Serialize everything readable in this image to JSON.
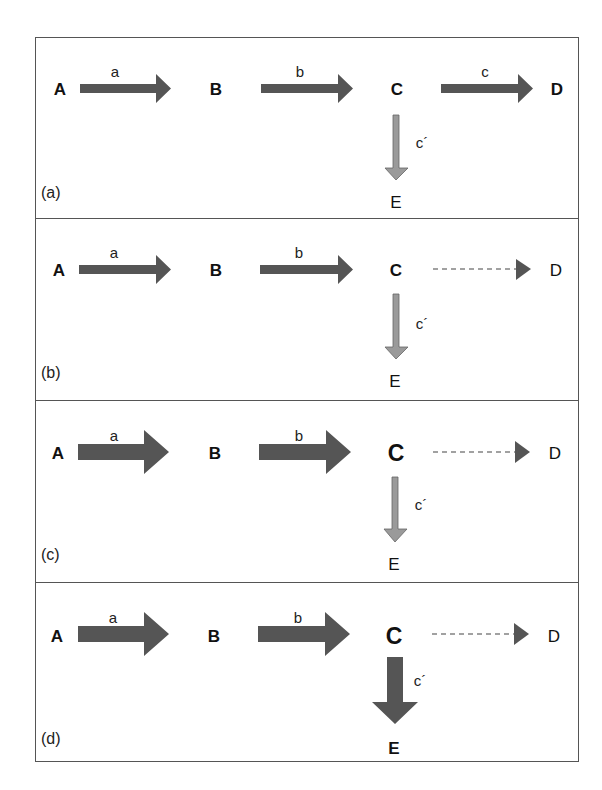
{
  "colors": {
    "strong_arrow": "#555555",
    "weak_arrow": "#9a9a9a",
    "border": "#555555",
    "text": "#111111"
  },
  "panels": [
    {
      "label": "(a)",
      "nodes": {
        "A": "A",
        "B": "B",
        "C": "C",
        "D": "D",
        "E": "E"
      },
      "edges": {
        "a": "a",
        "b": "b",
        "c": "c",
        "c_prime": "c´"
      },
      "styles": {
        "a": "solid-thin",
        "b": "solid-thin",
        "c": "solid-thin",
        "c_prime": "light-thin",
        "C_node": "bold",
        "D_node": "bold",
        "E_node": "regular"
      }
    },
    {
      "label": "(b)",
      "nodes": {
        "A": "A",
        "B": "B",
        "C": "C",
        "D": "D",
        "E": "E"
      },
      "edges": {
        "a": "a",
        "b": "b",
        "c_prime": "c´"
      },
      "styles": {
        "a": "solid-thin",
        "b": "solid-thin",
        "c": "dashed",
        "c_prime": "light-thin",
        "C_node": "bold",
        "D_node": "regular",
        "E_node": "regular"
      }
    },
    {
      "label": "(c)",
      "nodes": {
        "A": "A",
        "B": "B",
        "C": "C",
        "D": "D",
        "E": "E"
      },
      "edges": {
        "a": "a",
        "b": "b",
        "c_prime": "c´"
      },
      "styles": {
        "a": "solid-thick",
        "b": "solid-thick",
        "c": "dashed",
        "c_prime": "light-thin",
        "C_node": "large-bold",
        "D_node": "regular",
        "E_node": "regular"
      }
    },
    {
      "label": "(d)",
      "nodes": {
        "A": "A",
        "B": "B",
        "C": "C",
        "D": "D",
        "E": "E"
      },
      "edges": {
        "a": "a",
        "b": "b",
        "c_prime": "c´"
      },
      "styles": {
        "a": "solid-thick",
        "b": "solid-thick",
        "c": "dashed",
        "c_prime": "solid-thick",
        "C_node": "large-bold",
        "D_node": "regular",
        "E_node": "bold"
      }
    }
  ]
}
